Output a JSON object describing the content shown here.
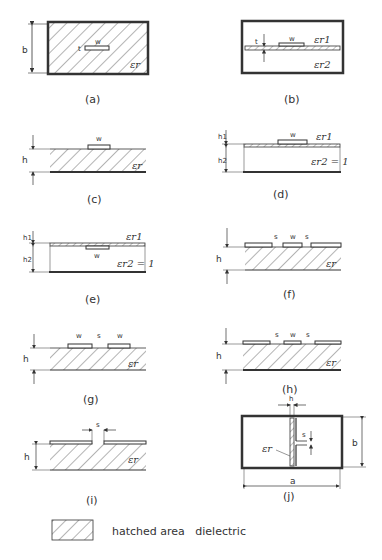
{
  "diagram": {
    "panels": [
      {
        "id": "a",
        "caption": "(a)",
        "labels": {
          "width": "w",
          "thickness": "t",
          "height": "b",
          "dielectric": "εr"
        }
      },
      {
        "id": "b",
        "caption": "(b)",
        "labels": {
          "width": "w",
          "thickness": "t",
          "upper_dielectric": "εr1",
          "lower_dielectric": "εr2"
        }
      },
      {
        "id": "c",
        "caption": "(c)",
        "labels": {
          "width": "w",
          "height": "h",
          "dielectric": "εr"
        }
      },
      {
        "id": "d",
        "caption": "(d)",
        "labels": {
          "width": "w",
          "h1": "h1",
          "h2": "h2",
          "dielectric1": "εr1",
          "dielectric2": "εr2 = 1"
        }
      },
      {
        "id": "e",
        "caption": "(e)",
        "labels": {
          "width": "w",
          "h1": "h1",
          "h2": "h2",
          "dielectric1": "εr1",
          "dielectric2": "εr2 = 1"
        }
      },
      {
        "id": "f",
        "caption": "(f)",
        "labels": {
          "gap1": "s",
          "width": "w",
          "gap2": "s",
          "height": "h",
          "dielectric": "εr"
        }
      },
      {
        "id": "g",
        "caption": "(g)",
        "labels": {
          "width1": "w",
          "gap": "s",
          "width2": "w",
          "height": "h",
          "dielectric": "εr"
        }
      },
      {
        "id": "h",
        "caption": "(h)",
        "labels": {
          "gap1": "s",
          "width": "w",
          "gap2": "s",
          "height": "h",
          "dielectric": "εr"
        }
      },
      {
        "id": "i",
        "caption": "(i)",
        "labels": {
          "gap": "s",
          "height": "h",
          "dielectric": "εr"
        }
      },
      {
        "id": "j",
        "caption": "(j)",
        "labels": {
          "thickness": "h",
          "gap": "s",
          "height": "b",
          "width": "a",
          "dielectric": "εr"
        }
      }
    ],
    "legend": {
      "text": "hatched area   dielectric"
    }
  }
}
